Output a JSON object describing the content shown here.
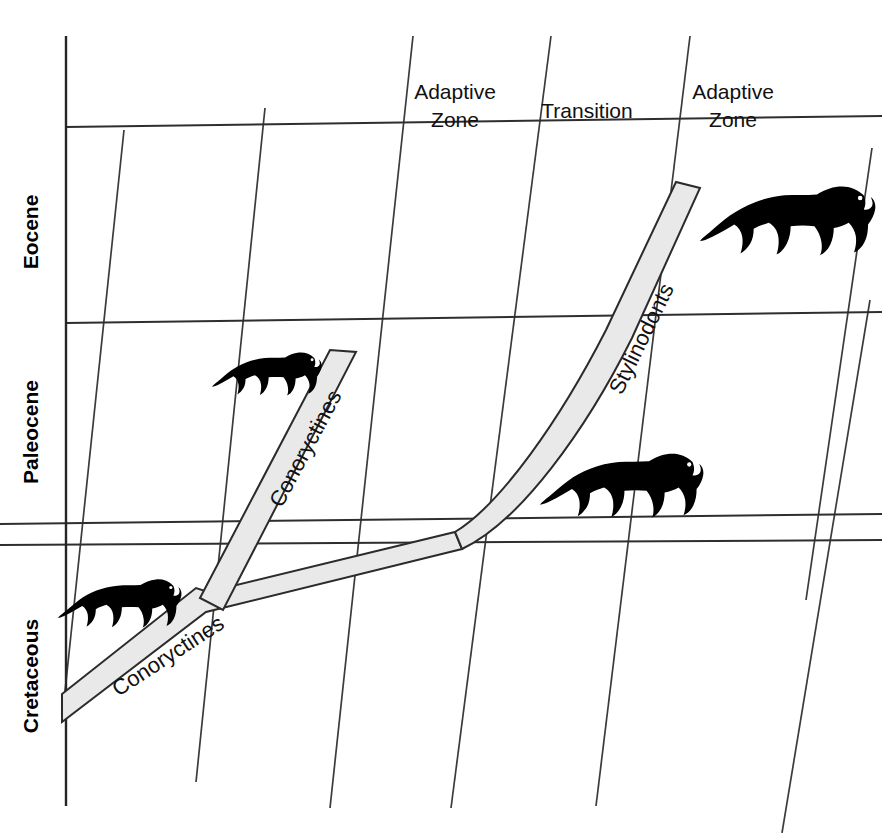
{
  "figure": {
    "type": "evolutionary-adaptive-zone-diagram",
    "background_color": "#ffffff",
    "line_color": "#2e2e2e",
    "band_fill_color": "#e9e9e9",
    "silhouette_color": "#000000",
    "width": 882,
    "height": 833
  },
  "axis": {
    "name": "geologic-time-axis",
    "orientation": "vertical",
    "epochs": [
      {
        "id": "eocene",
        "label": "Eocene",
        "label_x": 33,
        "label_y": 240
      },
      {
        "id": "paleocene",
        "label": "Paleocene",
        "label_x": 33,
        "label_y": 432
      },
      {
        "id": "cretaceous",
        "label": "Cretaceous",
        "label_x": 33,
        "label_y": 672
      }
    ],
    "boundaries": [
      {
        "id": "top-boundary",
        "y_left": 127,
        "y_right": 118
      },
      {
        "id": "eocene-paleocene-boundary",
        "y_left": 323,
        "y_right": 313
      },
      {
        "id": "paleocene-cretaceous-boundary-upper",
        "y_left": 520,
        "y_right": 515
      },
      {
        "id": "paleocene-cretaceous-boundary-lower",
        "y_left": 541,
        "y_right": 538
      }
    ]
  },
  "zones": [
    {
      "id": "adaptive-zone-left",
      "line1": "Adaptive",
      "line2": "Zone",
      "x": 455,
      "y1": 95,
      "y2": 123
    },
    {
      "id": "transition-zone",
      "line1": "Transition",
      "line2": "",
      "x": 587,
      "y1": 114,
      "y2": 114
    },
    {
      "id": "adaptive-zone-right",
      "line1": "Adaptive",
      "line2": "Zone",
      "x": 733,
      "y1": 95,
      "y2": 123
    }
  ],
  "lineages": [
    {
      "id": "conoryctines-lower",
      "label": "Conoryctines",
      "label_x": 172,
      "label_y": 660,
      "label_rotation": -33
    },
    {
      "id": "conoryctines-upper",
      "label": "Conoryctines",
      "label_x": 310,
      "label_y": 452,
      "label_rotation": -68
    },
    {
      "id": "stylinodonts",
      "label": "Stylinodonts",
      "label_x": 645,
      "label_y": 340,
      "label_rotation": -70
    }
  ],
  "silhouettes": [
    {
      "id": "animal-cretaceous-small",
      "name": "taeniodont-silhouette-cretaceous",
      "x": 58,
      "y": 572,
      "scale": 0.62,
      "flip": false
    },
    {
      "id": "animal-paleocene-small",
      "name": "taeniodont-silhouette-paleocene",
      "x": 212,
      "y": 344,
      "scale": 0.55,
      "flip": false
    },
    {
      "id": "animal-paleocene-large",
      "name": "taeniodont-silhouette-stylinodont-paleocene",
      "x": 540,
      "y": 442,
      "scale": 0.82,
      "flip": false
    },
    {
      "id": "animal-eocene-large",
      "name": "taeniodont-silhouette-stylinodont-eocene",
      "x": 703,
      "y": 172,
      "scale": 0.9,
      "flip": false
    }
  ],
  "diagonal_gridlines": [
    {
      "id": "diagonal-1",
      "x1": 205,
      "y1": 833,
      "x2": 124,
      "y2": 130
    },
    {
      "id": "diagonal-2",
      "x1": 330,
      "y1": 808,
      "x2": 413,
      "y2": 36
    },
    {
      "id": "diagonal-3",
      "x1": 451,
      "y1": 808,
      "x2": 551,
      "y2": 36
    },
    {
      "id": "diagonal-4",
      "x1": 596,
      "y1": 806,
      "x2": 690,
      "y2": 36
    },
    {
      "id": "diagonal-5",
      "x1": 198,
      "y1": 770,
      "x2": 265,
      "y2": 300
    },
    {
      "id": "diagonal-6",
      "x1": 300,
      "y1": 770,
      "x2": 380,
      "y2": 330
    },
    {
      "id": "diagonal-7",
      "x1": 408,
      "y1": 770,
      "x2": 480,
      "y2": 340
    },
    {
      "id": "diagonal-8",
      "x1": 760,
      "y1": 580,
      "x2": 822,
      "y2": 170
    },
    {
      "id": "diagonal-9",
      "x1": 690,
      "y1": 600,
      "x2": 752,
      "y2": 190
    }
  ]
}
